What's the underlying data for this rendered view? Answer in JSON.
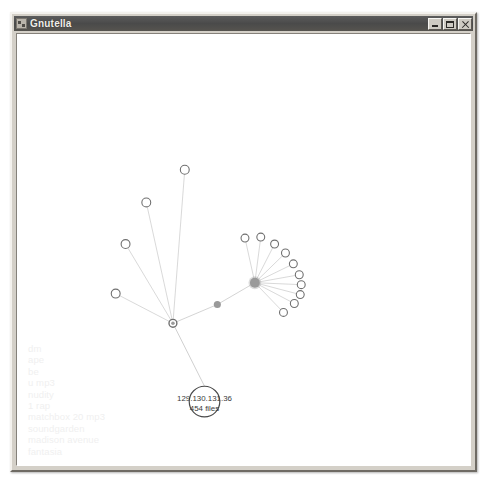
{
  "window": {
    "title": "Gnutella",
    "icon": "gnutella-app-icon",
    "controls": {
      "minimize_label": "Minimize",
      "maximize_label": "Maximize",
      "close_label": "Close"
    }
  },
  "legend": {
    "title": "active-search-terms",
    "items": [
      "dm",
      "ape",
      "be",
      "u mp3",
      "nudity",
      "1 rap",
      "matchbox 20 mp3",
      "soundgarden",
      "madison avenue",
      "fantasia"
    ]
  },
  "graph": {
    "selected_node": {
      "address": "129.130.131.36",
      "files": "454 files"
    },
    "colors": {
      "node_stroke": "#6f6f6f",
      "node_fill": "#ffffff",
      "hub_fill": "#9a9a9a",
      "edge": "#cfcfcf",
      "label_text": "#3a3a3a",
      "legend_text": "#f0f0f0",
      "canvas_bg": "#ffffff",
      "titlebar_bg": "#4f4f4f"
    },
    "hubs": [
      {
        "name": "hub-right",
        "cx": 241,
        "cy": 251,
        "r": 5.0
      },
      {
        "name": "hub-left",
        "cx": 158,
        "cy": 292,
        "r": 4.0
      },
      {
        "name": "bridge-node",
        "cx": 203,
        "cy": 273,
        "r": 3.6
      }
    ],
    "selected": {
      "name": "selected-peer",
      "cx": 190,
      "cy": 371,
      "r": 15.5
    },
    "leaves": [
      {
        "name": "peer-r1",
        "cx": 231,
        "cy": 206,
        "r": 4.0,
        "hub": "hub-right"
      },
      {
        "name": "peer-r2",
        "cx": 247,
        "cy": 205,
        "r": 4.0,
        "hub": "hub-right"
      },
      {
        "name": "peer-r3",
        "cx": 261,
        "cy": 212,
        "r": 4.0,
        "hub": "hub-right"
      },
      {
        "name": "peer-r4",
        "cx": 272,
        "cy": 221,
        "r": 4.0,
        "hub": "hub-right"
      },
      {
        "name": "peer-r5",
        "cx": 280,
        "cy": 232,
        "r": 4.0,
        "hub": "hub-right"
      },
      {
        "name": "peer-r6",
        "cx": 286,
        "cy": 243,
        "r": 4.0,
        "hub": "hub-right"
      },
      {
        "name": "peer-r7",
        "cx": 288,
        "cy": 253,
        "r": 4.0,
        "hub": "hub-right"
      },
      {
        "name": "peer-r8",
        "cx": 287,
        "cy": 263,
        "r": 4.0,
        "hub": "hub-right"
      },
      {
        "name": "peer-r9",
        "cx": 281,
        "cy": 272,
        "r": 4.0,
        "hub": "hub-right"
      },
      {
        "name": "peer-r10",
        "cx": 270,
        "cy": 281,
        "r": 4.0,
        "hub": "hub-right"
      },
      {
        "name": "peer-l1",
        "cx": 170,
        "cy": 137,
        "r": 4.5,
        "hub": "hub-left"
      },
      {
        "name": "peer-l2",
        "cx": 131,
        "cy": 170,
        "r": 4.5,
        "hub": "hub-left"
      },
      {
        "name": "peer-l3",
        "cx": 110,
        "cy": 212,
        "r": 4.5,
        "hub": "hub-left"
      },
      {
        "name": "peer-l4",
        "cx": 100,
        "cy": 262,
        "r": 4.5,
        "hub": "hub-left"
      }
    ]
  }
}
